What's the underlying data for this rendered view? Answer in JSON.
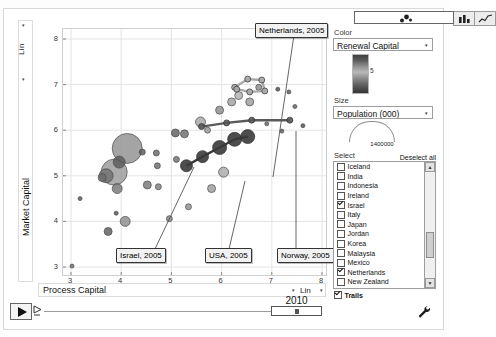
{
  "chart_type_buttons": [
    {
      "name": "bubble-chart",
      "selected": true
    },
    {
      "name": "bar-chart",
      "selected": false
    },
    {
      "name": "line-chart",
      "selected": false
    }
  ],
  "yaxis": {
    "title": "Market Capital",
    "scale": "Lin",
    "ticks": [
      "8",
      "7",
      "6",
      "5",
      "4",
      "3"
    ],
    "min": 3,
    "max": 8
  },
  "xaxis": {
    "title": "Process Capital",
    "scale": "Lin",
    "ticks": [
      "3",
      "4",
      "5",
      "6",
      "7",
      "8"
    ],
    "min": 3,
    "max": 8
  },
  "player": {
    "year": "2010",
    "play_label": "play-button"
  },
  "controls": {
    "color": {
      "label": "Color",
      "value": "Renewal Capital",
      "gradient_tick": "5"
    },
    "size": {
      "label": "Size",
      "value": "Population (000)",
      "legend_value": "1400000"
    },
    "select": {
      "label": "Select",
      "deselect_all": "Deselect all"
    },
    "trails": {
      "label": "Trails",
      "checked": true
    }
  },
  "country_list": [
    {
      "label": "Iceland",
      "checked": false
    },
    {
      "label": "India",
      "checked": false
    },
    {
      "label": "Indonesia",
      "checked": false
    },
    {
      "label": "Ireland",
      "checked": false
    },
    {
      "label": "Israel",
      "checked": true
    },
    {
      "label": "Italy",
      "checked": false
    },
    {
      "label": "Japan",
      "checked": false
    },
    {
      "label": "Jordan",
      "checked": false
    },
    {
      "label": "Korea",
      "checked": false
    },
    {
      "label": "Malaysia",
      "checked": false
    },
    {
      "label": "Mexico",
      "checked": false
    },
    {
      "label": "Netherlands",
      "checked": true
    },
    {
      "label": "New Zealand",
      "checked": false
    },
    {
      "label": "Norway",
      "checked": true
    }
  ],
  "annotations": [
    {
      "label": "Netherlands, 2005",
      "x": 255,
      "y": 23,
      "lx": 293,
      "ly": 34,
      "tx": 272,
      "ty": 176
    },
    {
      "label": "Israel, 2005",
      "x": 116,
      "y": 248,
      "lx": 154,
      "ly": 248,
      "tx": 193,
      "ty": 166
    },
    {
      "label": "USA, 2005",
      "x": 205,
      "y": 248,
      "lx": 228,
      "ly": 248,
      "tx": 244,
      "ty": 180
    },
    {
      "label": "Norway, 2005",
      "x": 277,
      "y": 248,
      "lx": 295,
      "ly": 248,
      "tx": 295,
      "ty": 130
    }
  ],
  "chart_data": {
    "type": "scatter",
    "title": "",
    "xlabel": "Process Capital",
    "ylabel": "Market Capital",
    "xlim": [
      3,
      8
    ],
    "ylim": [
      3,
      8
    ],
    "grid": true,
    "legend_position": "right-panel",
    "color_variable": "Renewal Capital",
    "size_variable": "Population (000)",
    "year": 2010,
    "bubbles": [
      {
        "x": 4.12,
        "y": 5.6,
        "r": 15,
        "c": "#909090"
      },
      {
        "x": 3.86,
        "y": 5.08,
        "r": 13,
        "c": "#9a9a9a"
      },
      {
        "x": 3.7,
        "y": 5.0,
        "r": 7,
        "c": "#707070"
      },
      {
        "x": 3.96,
        "y": 5.3,
        "r": 6,
        "c": "#5a5a5a"
      },
      {
        "x": 3.62,
        "y": 4.96,
        "r": 4,
        "c": "#6e6e6e"
      },
      {
        "x": 3.92,
        "y": 4.72,
        "r": 5,
        "c": "#757575"
      },
      {
        "x": 4.42,
        "y": 5.52,
        "r": 3,
        "c": "#5c5c5c"
      },
      {
        "x": 4.7,
        "y": 5.5,
        "r": 3,
        "c": "#666666"
      },
      {
        "x": 4.72,
        "y": 5.22,
        "r": 3,
        "c": "#6a6a6a"
      },
      {
        "x": 4.52,
        "y": 4.8,
        "r": 4,
        "c": "#777777"
      },
      {
        "x": 4.74,
        "y": 4.76,
        "r": 3,
        "c": "#808080"
      },
      {
        "x": 5.08,
        "y": 5.94,
        "r": 4,
        "c": "#5f5f5f"
      },
      {
        "x": 5.26,
        "y": 5.92,
        "r": 4,
        "c": "#6b6b6b"
      },
      {
        "x": 5.1,
        "y": 5.36,
        "r": 3,
        "c": "#6e6e6e"
      },
      {
        "x": 4.08,
        "y": 4.0,
        "r": 5,
        "c": "#8b8b8b"
      },
      {
        "x": 3.74,
        "y": 3.78,
        "r": 4,
        "c": "#5e5e5e"
      },
      {
        "x": 3.9,
        "y": 4.18,
        "r": 2,
        "c": "#4f4f4f"
      },
      {
        "x": 3.18,
        "y": 4.5,
        "r": 2,
        "c": "#595959"
      },
      {
        "x": 3.02,
        "y": 3.02,
        "r": 2,
        "c": "#6b6b6b"
      },
      {
        "x": 5.58,
        "y": 6.18,
        "r": 5,
        "c": "#a6a6a6"
      },
      {
        "x": 5.72,
        "y": 6.0,
        "r": 3,
        "c": "#979797"
      },
      {
        "x": 5.96,
        "y": 6.44,
        "r": 4,
        "c": "#8d8d8d"
      },
      {
        "x": 6.2,
        "y": 6.62,
        "r": 4,
        "c": "#a2a2a2"
      },
      {
        "x": 6.34,
        "y": 6.76,
        "r": 4,
        "c": "#b0b0b0"
      },
      {
        "x": 6.56,
        "y": 6.62,
        "r": 4,
        "c": "#9d9d9d"
      },
      {
        "x": 6.74,
        "y": 6.94,
        "r": 3,
        "c": "#8a8a8a"
      },
      {
        "x": 7.12,
        "y": 6.9,
        "r": 2,
        "c": "#4b4b4b"
      },
      {
        "x": 7.34,
        "y": 6.84,
        "r": 2,
        "c": "#555555"
      },
      {
        "x": 7.46,
        "y": 6.52,
        "r": 2,
        "c": "#5f5f5f"
      },
      {
        "x": 6.9,
        "y": 6.14,
        "r": 2,
        "c": "#646464"
      },
      {
        "x": 7.2,
        "y": 5.98,
        "r": 2,
        "c": "#585858"
      },
      {
        "x": 7.62,
        "y": 6.1,
        "r": 2,
        "c": "#4e4e4e"
      },
      {
        "x": 6.04,
        "y": 5.08,
        "r": 5,
        "c": "#a9a9a9"
      },
      {
        "x": 5.8,
        "y": 4.72,
        "r": 4,
        "c": "#9e9e9e"
      },
      {
        "x": 5.34,
        "y": 4.32,
        "r": 3,
        "c": "#8f8f8f"
      },
      {
        "x": 4.96,
        "y": 4.06,
        "r": 3,
        "c": "#828282"
      }
    ],
    "trails": [
      {
        "name": "Israel",
        "color": "#3a3a3a",
        "points": [
          {
            "x": 5.3,
            "y": 5.22,
            "r": 6
          },
          {
            "x": 5.62,
            "y": 5.42,
            "r": 6
          },
          {
            "x": 5.96,
            "y": 5.62,
            "r": 7
          },
          {
            "x": 6.26,
            "y": 5.8,
            "r": 7
          },
          {
            "x": 6.52,
            "y": 5.86,
            "r": 7
          }
        ]
      },
      {
        "name": "Netherlands",
        "color": "#a8a8a8",
        "points": [
          {
            "x": 6.26,
            "y": 6.94,
            "r": 3
          },
          {
            "x": 6.52,
            "y": 7.12,
            "r": 3
          },
          {
            "x": 6.8,
            "y": 7.1,
            "r": 3
          },
          {
            "x": 6.86,
            "y": 6.86,
            "r": 3
          },
          {
            "x": 6.56,
            "y": 6.84,
            "r": 3
          },
          {
            "x": 6.3,
            "y": 6.9,
            "r": 3
          }
        ]
      },
      {
        "name": "Norway",
        "color": "#5a5a5a",
        "points": [
          {
            "x": 5.6,
            "y": 6.08,
            "r": 3
          },
          {
            "x": 6.1,
            "y": 6.16,
            "r": 3
          },
          {
            "x": 6.6,
            "y": 6.22,
            "r": 3
          },
          {
            "x": 7.36,
            "y": 6.22,
            "r": 3
          }
        ]
      }
    ]
  }
}
